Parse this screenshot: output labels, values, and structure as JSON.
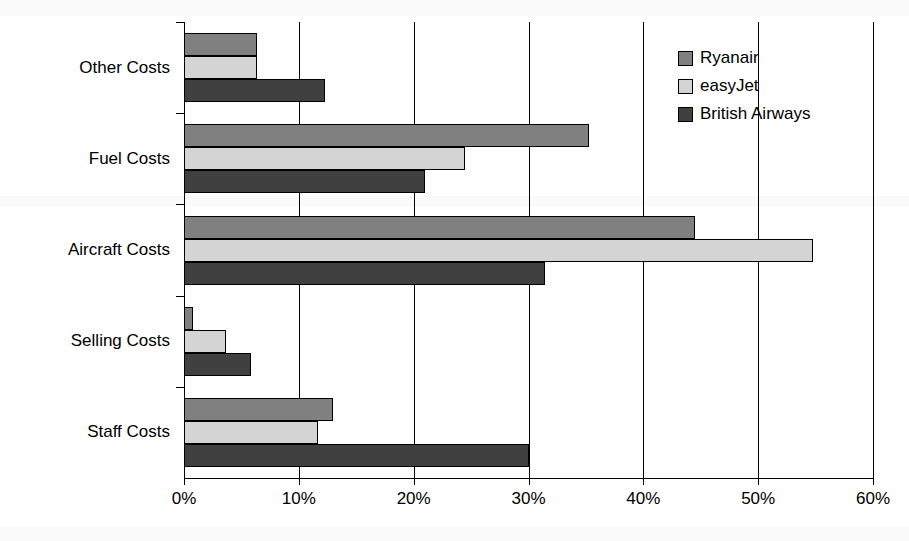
{
  "chart_data": {
    "type": "bar",
    "orientation": "horizontal",
    "title": "",
    "subtitle": "",
    "xlabel": "",
    "ylabel": "",
    "xlim": [
      0,
      60
    ],
    "xtick_values": [
      0,
      10,
      20,
      30,
      40,
      50,
      60
    ],
    "xtick_labels": [
      "0%",
      "10%",
      "20%",
      "30%",
      "40%",
      "50%",
      "60%"
    ],
    "grid": true,
    "grid_axis": "x",
    "legend_position": "top-right",
    "value_unit": "%",
    "categories": [
      "Other Costs",
      "Fuel Costs",
      "Aircraft Costs",
      "Selling Costs",
      "Staff Costs"
    ],
    "series": [
      {
        "name": "Ryanair",
        "color": "#808080",
        "values": [
          6.4,
          35.3,
          44.5,
          0.8,
          13.0
        ]
      },
      {
        "name": "easyJet",
        "color": "#d4d4d4",
        "values": [
          6.4,
          24.5,
          54.8,
          3.7,
          11.7
        ]
      },
      {
        "name": "British Airways",
        "color": "#404040",
        "values": [
          12.3,
          21.0,
          31.4,
          5.8,
          30.0
        ]
      }
    ]
  },
  "legend": {
    "items": [
      {
        "label": "Ryanair",
        "color": "#808080"
      },
      {
        "label": "easyJet",
        "color": "#d4d4d4"
      },
      {
        "label": "British Airways",
        "color": "#404040"
      }
    ]
  },
  "axis": {
    "x_labels": [
      "0%",
      "10%",
      "20%",
      "30%",
      "40%",
      "50%",
      "60%"
    ],
    "y_labels": [
      "Other Costs",
      "Fuel Costs",
      "Aircraft Costs",
      "Selling Costs",
      "Staff Costs"
    ]
  },
  "colors": {
    "ryanair": "#808080",
    "easyjet": "#d4d4d4",
    "british_airways": "#404040",
    "axis": "#000000",
    "background": "#ffffff"
  }
}
